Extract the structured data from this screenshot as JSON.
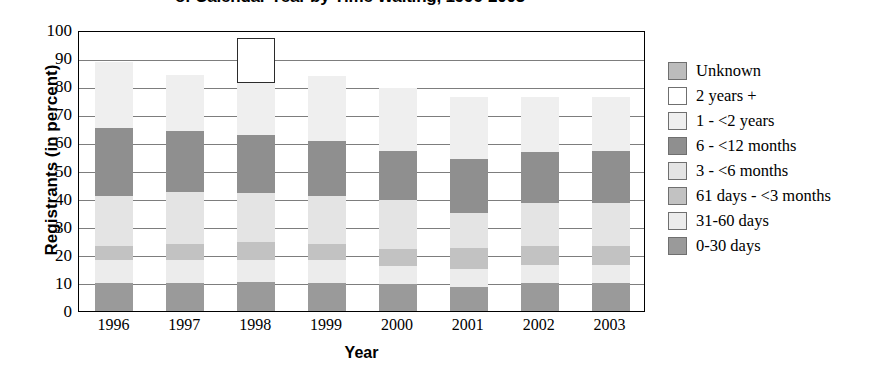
{
  "chart_data": {
    "type": "bar",
    "stacked": true,
    "title": "of Calendar Year by Time Waiting, 1996-2003",
    "xlabel": "Year",
    "ylabel": "Registrants (in percent)",
    "categories": [
      "1996",
      "1997",
      "1998",
      "1999",
      "2000",
      "2001",
      "2002",
      "2003"
    ],
    "ylim": [
      0,
      100
    ],
    "yticks": [
      "0",
      "10",
      "20",
      "30",
      "40",
      "50",
      "60",
      "70",
      "80",
      "90",
      "100"
    ],
    "grid": true,
    "legend_position": "right",
    "series": [
      {
        "name": "0-30 days",
        "color": "#9a9a9a",
        "values": [
          10.0,
          10.0,
          10.5,
          10.0,
          9.5,
          8.5,
          10.0,
          10.0
        ]
      },
      {
        "name": "31-60 days",
        "color": "#ececec",
        "values": [
          8.0,
          8.0,
          7.5,
          8.0,
          6.5,
          6.5,
          6.5,
          6.5
        ]
      },
      {
        "name": "61 days - <3 months",
        "color": "#c2c2c2",
        "values": [
          5.0,
          6.0,
          6.5,
          6.0,
          6.0,
          7.5,
          6.5,
          6.5
        ]
      },
      {
        "name": "3 - <6 months",
        "color": "#e4e4e4",
        "values": [
          18.0,
          18.5,
          17.5,
          17.0,
          17.5,
          12.5,
          15.5,
          15.5
        ]
      },
      {
        "name": "6 - <12 months",
        "color": "#8f8f8f",
        "values": [
          24.0,
          21.5,
          20.5,
          19.5,
          17.5,
          19.0,
          18.0,
          18.5
        ]
      },
      {
        "name": "1 - <2 years",
        "color": "#efefef",
        "values": [
          23.5,
          20.0,
          18.5,
          23.0,
          22.5,
          22.0,
          19.5,
          19.0
        ]
      },
      {
        "name": "2 years +",
        "color": "#ffffff",
        "values": [
          0.0,
          0.0,
          16.0,
          0.0,
          0.0,
          0.0,
          0.0,
          0.0
        ]
      },
      {
        "name": "Unknown",
        "color": "#bcbcbc",
        "values": [
          0.0,
          0.0,
          0.0,
          0.0,
          0.0,
          0.0,
          0.0,
          0.0
        ]
      }
    ],
    "bar_totals": [
      88.5,
      84.0,
      97.0,
      83.5,
      79.5,
      76.0,
      76.0,
      76.0
    ]
  },
  "legend": {
    "items": [
      {
        "label": "Unknown",
        "color": "#bcbcbc",
        "outlined": false
      },
      {
        "label": "2 years +",
        "color": "#ffffff",
        "outlined": true
      },
      {
        "label": "1 - <2 years",
        "color": "#efefef",
        "outlined": false
      },
      {
        "label": "6 - <12 months",
        "color": "#8f8f8f",
        "outlined": false
      },
      {
        "label": "3 - <6 months",
        "color": "#e4e4e4",
        "outlined": false
      },
      {
        "label": "61 days - <3 months",
        "color": "#c2c2c2",
        "outlined": false
      },
      {
        "label": "31-60 days",
        "color": "#ececec",
        "outlined": false
      },
      {
        "label": "0-30 days",
        "color": "#9a9a9a",
        "outlined": false
      }
    ]
  },
  "colors": {
    "axis": "#000000",
    "gridline": "#7d7d7d",
    "background": "#ffffff"
  }
}
